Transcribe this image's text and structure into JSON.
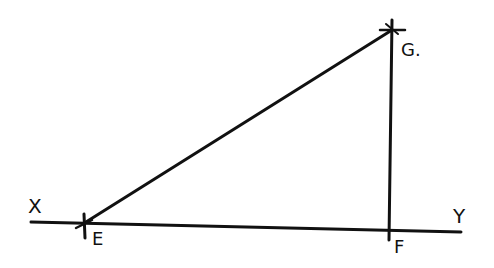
{
  "diagram": {
    "type": "geometric-construction",
    "line_color": "#111111",
    "labels": {
      "x": "X",
      "y": "Y",
      "e": "E",
      "f": "F",
      "g": "G."
    },
    "points": {
      "X_end": [
        31,
        222
      ],
      "Y_end": [
        461,
        232
      ],
      "E": [
        85,
        223
      ],
      "F": [
        389,
        230
      ],
      "G": [
        393,
        29
      ]
    },
    "segments": [
      {
        "name": "XY",
        "from": "X_end",
        "to": "Y_end"
      },
      {
        "name": "EG",
        "from": "E",
        "to": "G"
      },
      {
        "name": "FG",
        "from": "F",
        "to": "G"
      }
    ]
  }
}
